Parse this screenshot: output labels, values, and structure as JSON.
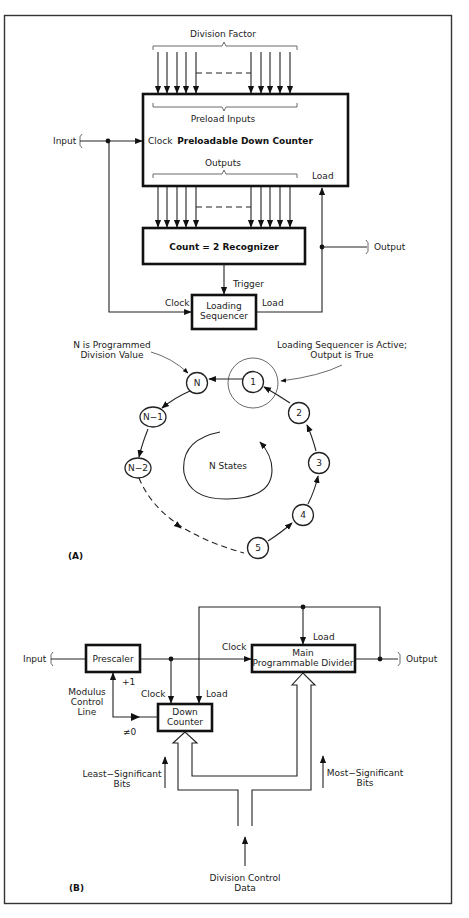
{
  "panel_a": {
    "label": "(A)",
    "division_factor": "Division Factor",
    "preload_inputs": "Preload Inputs",
    "counter_title": "Preloadable Down Counter",
    "clock_in": "Clock",
    "input": "Input",
    "outputs": "Outputs",
    "load_in": "Load",
    "recognizer": "Count = 2 Recognizer",
    "output": "Output",
    "trigger": "Trigger",
    "seq_clock": "Clock",
    "seq_load": "Load",
    "sequencer_line1": "Loading",
    "sequencer_line2": "Sequencer",
    "note_n_line1": "N is Programmed",
    "note_n_line2": "Division Value",
    "note_active_line1": "Loading Sequencer is Active;",
    "note_active_line2": "Output is True",
    "center_label": "N States",
    "states": {
      "n": "N",
      "s1": "1",
      "s2": "2",
      "s3": "3",
      "s4": "4",
      "s5": "5",
      "nm1": "N−1",
      "nm2": "N−2"
    }
  },
  "panel_b": {
    "label": "(B)",
    "input": "Input",
    "prescaler": "Prescaler",
    "clock_main": "Clock",
    "load_main": "Load",
    "main_line1": "Main",
    "main_line2": "Programmable Divider",
    "output": "Output",
    "plus1": "+1",
    "modulus_line1": "Modulus",
    "modulus_line2": "Control",
    "modulus_line3": "Line",
    "dc_clock": "Clock",
    "dc_load": "Load",
    "down_line1": "Down",
    "down_line2": "Counter",
    "neq0": "≠0",
    "lsb_line1": "Least−Significant",
    "lsb_line2": "Bits",
    "msb_line1": "Most−Significant",
    "msb_line2": "Bits",
    "dcd_line1": "Division Control",
    "dcd_line2": "Data"
  }
}
